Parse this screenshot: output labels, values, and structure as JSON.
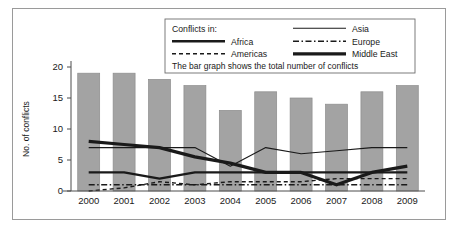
{
  "chart_data": {
    "type": "bar",
    "title": "",
    "xlabel": "",
    "ylabel": "No. of conflicts",
    "ylim": [
      0,
      20
    ],
    "yticks": [
      0,
      5,
      10,
      15,
      20
    ],
    "grid": false,
    "categories": [
      "2000",
      "2001",
      "2002",
      "2003",
      "2004",
      "2005",
      "2006",
      "2007",
      "2008",
      "2009"
    ],
    "values": [
      19,
      19,
      18,
      17,
      13,
      16,
      15,
      14,
      16,
      17
    ],
    "bar_series_name": "Total number of conflicts",
    "bar_color": "#a3a3a3",
    "series": [
      {
        "name": "Africa",
        "style": "thick-solid",
        "color": "#1a1a1a",
        "values": [
          3,
          3,
          2,
          3,
          3,
          3,
          3,
          3,
          3,
          3
        ]
      },
      {
        "name": "Americas",
        "style": "dashed",
        "color": "#1a1a1a",
        "values": [
          0,
          0.5,
          1.5,
          1,
          1.5,
          1.5,
          1.5,
          2,
          2,
          2
        ]
      },
      {
        "name": "Asia",
        "style": "thin-solid",
        "color": "#1a1a1a",
        "values": [
          7,
          7,
          7,
          7,
          4,
          7,
          6,
          6.5,
          7,
          7
        ]
      },
      {
        "name": "Europe",
        "style": "dash-dot",
        "color": "#1a1a1a",
        "values": [
          1,
          1,
          1,
          1,
          1,
          1,
          1,
          1,
          1,
          1
        ]
      },
      {
        "name": "Middle East",
        "style": "very-thick-solid",
        "color": "#1a1a1a",
        "values": [
          8,
          7.5,
          7,
          5.5,
          4.5,
          3,
          3,
          1,
          3,
          4
        ]
      }
    ],
    "legend": {
      "position": "top-center",
      "heading": "Conflicts in:",
      "note": "The bar graph shows the total number of conflicts",
      "entries": [
        {
          "label": "Africa",
          "style": "thick-solid"
        },
        {
          "label": "Americas",
          "style": "dashed"
        },
        {
          "label": "Asia",
          "style": "thin-solid"
        },
        {
          "label": "Europe",
          "style": "dash-dot"
        },
        {
          "label": "Middle East",
          "style": "very-thick-solid"
        }
      ]
    }
  }
}
